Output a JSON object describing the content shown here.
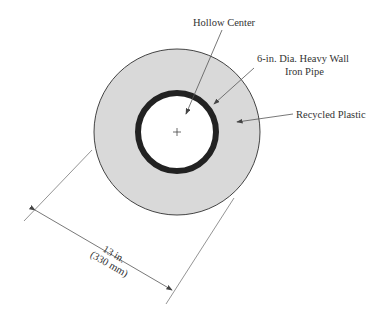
{
  "labels": {
    "hollow_center": "Hollow Center",
    "pipe_line1": "6-in. Dia. Heavy Wall",
    "pipe_line2": "Iron Pipe",
    "recycled_plastic": "Recycled Plastic",
    "dimension_line1": "13 in.",
    "dimension_line2": "(330 mm)"
  },
  "colors": {
    "plastic_fill": "#d9d9d9",
    "pipe": "#222222",
    "line": "#555555"
  }
}
